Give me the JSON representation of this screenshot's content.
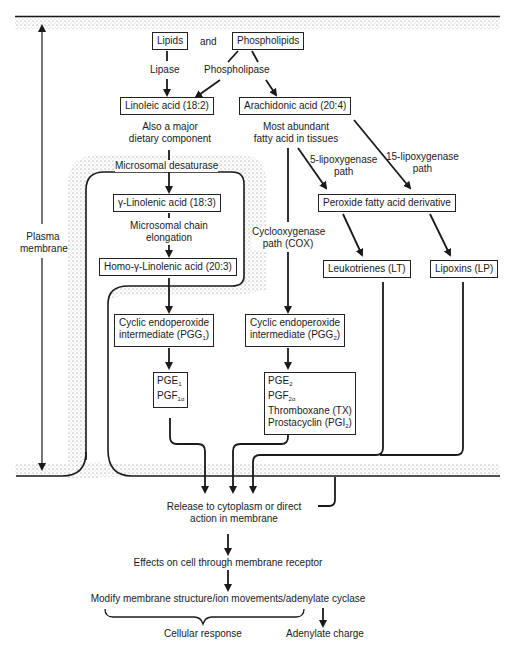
{
  "diagram": {
    "membrane_label": [
      "Plasma",
      "membrane"
    ],
    "nodes": {
      "lipids": "Lipids",
      "and": "and",
      "phospholipids": "Phospholipids",
      "lipase": "Lipase",
      "phospholipase": "Phospholipase",
      "linoleic": "Linoleic acid (18:2)",
      "linoleic_note": [
        "Also a major",
        "dietary component"
      ],
      "arachidonic": "Arachidonic acid (20:4)",
      "arachidonic_note": [
        "Most abundant",
        "fatty acid in tissues"
      ],
      "microsomal_desaturase": "Microsomal desaturase",
      "gamma_linolenic": "γ-Linolenic acid (18:3)",
      "chain_elongation": [
        "Microsomal chain",
        "elongation"
      ],
      "homo_gamma": "Homo-γ-Linolenic acid (20:3)",
      "lipox5": [
        "5-lipoxygenase",
        "path"
      ],
      "lipox15": [
        "15-lipoxygenase",
        "path"
      ],
      "peroxide": "Peroxide fatty acid derivative",
      "cox": [
        "Cyclooxygenase",
        "path (COX)"
      ],
      "leukotrienes": "Leukotrienes (LT)",
      "lipoxins": "Lipoxins (LP)",
      "pgg1": [
        "Cyclic endoperoxide",
        "intermediate (PGG",
        "1",
        ")"
      ],
      "pgg2": [
        "Cyclic endoperoxide",
        "intermediate (PGG",
        "2",
        ")"
      ],
      "series1": [
        {
          "base": "PGE",
          "sub": "1"
        },
        {
          "base": "PGF",
          "sub": "1α"
        }
      ],
      "series2": [
        {
          "base": "PGE",
          "sub": "2"
        },
        {
          "base": "PGF",
          "sub": "2α"
        },
        {
          "base": "Thromboxane (TX)",
          "sub": ""
        },
        {
          "base": "Prostacyclin (PGI",
          "sub": "2",
          "tail": ")"
        }
      ],
      "release": [
        "Release to cytoplasm or direct",
        "action in membrane"
      ],
      "effects": "Effects on cell through membrane receptor",
      "modify": "Modify membrane structure/ion movements/adenylate cyclase",
      "cellular_response": "Cellular response",
      "adenylate_charge": "Adenylate charge"
    },
    "colors": {
      "ink": "#1a1a1a",
      "stipple": "#8a8a8a",
      "background": "#ffffff"
    }
  }
}
